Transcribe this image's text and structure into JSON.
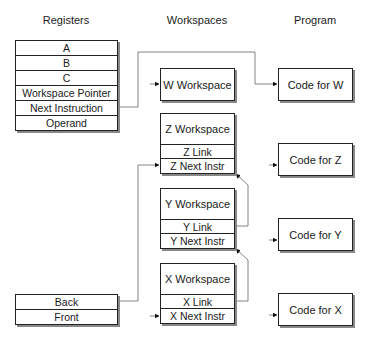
{
  "headers": {
    "registers": "Registers",
    "workspaces": "Workspaces",
    "program": "Program"
  },
  "registers": {
    "rows": [
      "A",
      "B",
      "C",
      "Workspace Pointer",
      "Next Instruction",
      "Operand"
    ]
  },
  "queue": {
    "rows": [
      "Back",
      "Front"
    ]
  },
  "workspaces": {
    "w": {
      "title": "W Workspace"
    },
    "z": {
      "title": "Z Workspace",
      "link": "Z Link",
      "next": "Z Next Instr"
    },
    "y": {
      "title": "Y Workspace",
      "link": "Y Link",
      "next": "Y Next Instr"
    },
    "x": {
      "title": "X Workspace",
      "link": "X Link",
      "next": "X Next Instr"
    }
  },
  "program": {
    "w": "Code for W",
    "z": "Code for Z",
    "y": "Code for Y",
    "x": "Code for X"
  },
  "colors": {
    "line": "#555555",
    "border": "#222222",
    "shadow": "#888888"
  }
}
